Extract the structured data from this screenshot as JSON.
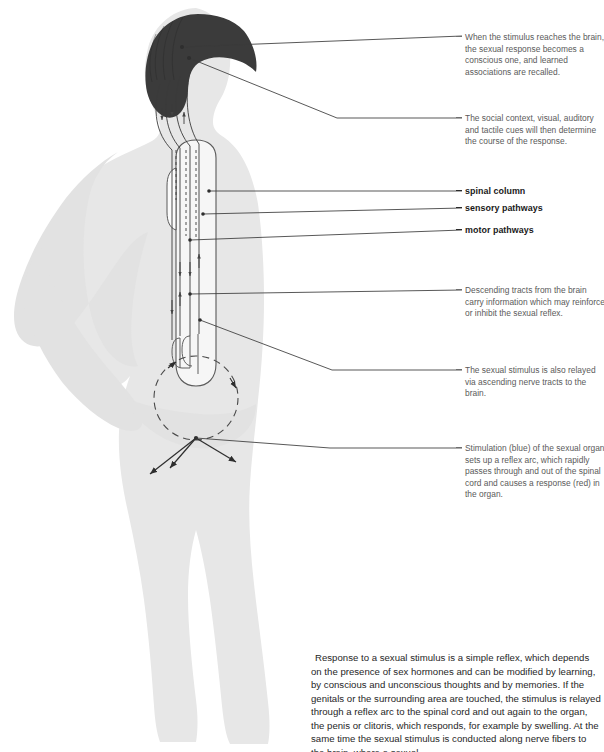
{
  "figure": {
    "title_hidden": "",
    "colors": {
      "silhouette": "#e6e6e6",
      "silhouette_shadow": "#dcdcdc",
      "brain": "#3a3a3a",
      "line": "#333333",
      "cord_outline": "#555555",
      "cord_fill": "#f4f4f4",
      "callout_text": "#5a5a5a",
      "label_text": "#1a1a1a",
      "body_text": "#1f1f1f",
      "page_background": "#ffffff"
    },
    "anatomy": {
      "brain_label": "brain",
      "spinal_cord_label": "spinal cord",
      "reflex_arc_label": "reflex arc",
      "sexual_organ_label": "sexual organ"
    }
  },
  "callouts": [
    {
      "id": "brain-conscious-response",
      "text": "When the stimulus reaches the brain, the sexual response becomes a conscious one, and learned associations are recalled.",
      "bold": false,
      "x": 465,
      "y": 32
    },
    {
      "id": "social-context-cues",
      "text": "The social context, visual, auditory and tactile cues will then determine the course of the response.",
      "bold": false,
      "x": 465,
      "y": 113
    },
    {
      "id": "spinal-column",
      "text": "spinal column",
      "bold": true,
      "x": 465,
      "y": 187
    },
    {
      "id": "sensory-pathways",
      "text": "sensory pathways",
      "bold": true,
      "x": 465,
      "y": 204
    },
    {
      "id": "motor-pathways",
      "text": "motor pathways",
      "bold": true,
      "x": 465,
      "y": 226
    },
    {
      "id": "descending-tracts",
      "text": "Descending tracts from the brain carry information which may reinforce or inhibit the sexual reflex.",
      "bold": false,
      "x": 465,
      "y": 285
    },
    {
      "id": "ascending-nerve-tracts",
      "text": "The sexual stimulus is also relayed via ascending nerve tracts to the brain.",
      "bold": false,
      "x": 465,
      "y": 360
    },
    {
      "id": "stimulation-reflex-arc",
      "text": "Stimulation (blue) of the sexual organ sets up a reflex arc, which rapidly passes through and out of the spinal cord and causes a response (red) in the organ.",
      "bold": false,
      "x": 465,
      "y": 440
    }
  ],
  "body_text": {
    "paragraph": "Response to a sexual stimulus is a simple reflex, which depends on the presence of sex hormones and can be modified by learning, by conscious and unconscious thoughts and by memories. If the genitals or the surrounding area are touched, the stimulus is relayed through a reflex arc to the spinal cord and out again to the organ, the penis or clitoris, which responds, for example by swelling. At the same time the sexual stimulus is conducted along nerve fibers to the brain, where a sexual"
  }
}
